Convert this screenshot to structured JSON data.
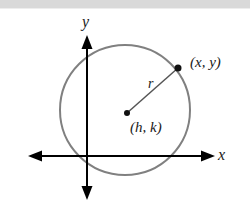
{
  "figure": {
    "name": "circle-standard-form-diagram",
    "width": 250,
    "height": 205,
    "background_color": "#ffffff",
    "top_band_color": "#d9d9d9"
  },
  "axes": {
    "color": "#000000",
    "stroke_width": 2,
    "origin": {
      "x": 87,
      "y": 156
    },
    "x_axis": {
      "label": "x",
      "start_x": 28,
      "end_x": 215,
      "y": 156,
      "arrow_left": true,
      "arrow_right": true
    },
    "y_axis": {
      "label": "y",
      "x": 87,
      "start_y": 35,
      "end_y": 200,
      "arrow_up": true,
      "arrow_down": true
    }
  },
  "circle": {
    "color": "#808080",
    "stroke_width": 2,
    "center_x": 125,
    "center_y": 110,
    "radius": 65,
    "fill": "none"
  },
  "center_point": {
    "label": "(h, k)",
    "x": 127,
    "y": 113,
    "dot_radius": 3,
    "dot_color": "#111111"
  },
  "circle_point": {
    "label": "(x, y)",
    "x": 178,
    "y": 68,
    "dot_radius": 3.5,
    "dot_color": "#111111"
  },
  "radius_segment": {
    "label": "r",
    "color": "#555555",
    "stroke_width": 1.5,
    "from_x": 127,
    "from_y": 113,
    "to_x": 178,
    "to_y": 68
  }
}
